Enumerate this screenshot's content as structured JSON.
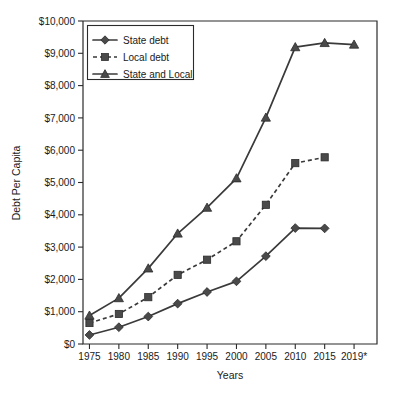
{
  "chart_data": {
    "type": "line",
    "title": "",
    "xlabel": "Years",
    "ylabel": "Debt Per Capita",
    "categories": [
      "1975",
      "1980",
      "1985",
      "1990",
      "1995",
      "2000",
      "2005",
      "2010",
      "2015",
      "2019*"
    ],
    "ylim": [
      0,
      10000
    ],
    "ytick_labels": [
      "$0",
      "$1,000",
      "$2,000",
      "$3,000",
      "$4,000",
      "$5,000",
      "$6,000",
      "$7,000",
      "$8,000",
      "$9,000",
      "$10,000"
    ],
    "ytick_values": [
      0,
      1000,
      2000,
      3000,
      4000,
      5000,
      6000,
      7000,
      8000,
      9000,
      10000
    ],
    "grid": false,
    "legend_position": "top-left",
    "series": [
      {
        "name": "State debt",
        "marker": "diamond",
        "line_style": "solid",
        "values": [
          280,
          520,
          850,
          1250,
          1610,
          1940,
          2720,
          3590,
          3580,
          null
        ]
      },
      {
        "name": "Local debt",
        "marker": "square",
        "line_style": "dashed",
        "values": [
          650,
          930,
          1450,
          2140,
          2610,
          3180,
          4310,
          5600,
          5780,
          null
        ]
      },
      {
        "name": "State and Local",
        "marker": "triangle",
        "line_style": "solid",
        "values": [
          880,
          1420,
          2340,
          3420,
          4220,
          5130,
          7010,
          9190,
          9320,
          9270
        ]
      }
    ]
  },
  "legend": {
    "items": [
      {
        "label": "State debt"
      },
      {
        "label": "Local debt"
      },
      {
        "label": "State and Local"
      }
    ]
  }
}
